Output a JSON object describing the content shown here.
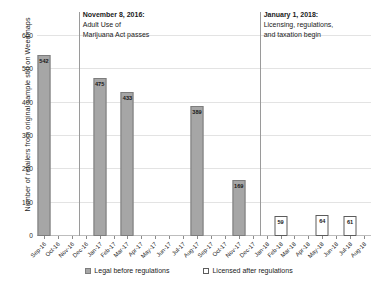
{
  "chart_data": {
    "type": "bar",
    "title": "",
    "xlabel": "",
    "ylabel": "Number of retailers from original sample still on Weedmaps",
    "ylim": [
      0,
      600
    ],
    "y_ticks": [
      0,
      100,
      200,
      300,
      400,
      500,
      600
    ],
    "grid": true,
    "legend_position": "bottom",
    "categories": [
      "Sep-16",
      "Oct-16",
      "Nov-16",
      "Dec-16",
      "Jan-17",
      "Feb-17",
      "Mar-17",
      "Apr-17",
      "May-17",
      "Jun-17",
      "Jul-17",
      "Aug-17",
      "Sep-17",
      "Oct-17",
      "Nov-17",
      "Dec-17",
      "Jan-18",
      "Feb-18",
      "Mar-18",
      "Apr-18",
      "May-18",
      "Jun-18",
      "Jul-18",
      "Aug-18"
    ],
    "series": [
      {
        "name": "Legal before regulations",
        "color": "#a6a6a6",
        "points": [
          {
            "category": "Sep-16",
            "value": 542
          },
          {
            "category": "Jan-17",
            "value": 475
          },
          {
            "category": "Mar-17",
            "value": 433
          },
          {
            "category": "Aug-17",
            "value": 389
          },
          {
            "category": "Nov-17",
            "value": 169
          }
        ]
      },
      {
        "name": "Licensed after regulations",
        "color": "#ffffff",
        "points": [
          {
            "category": "Feb-18",
            "value": 59
          },
          {
            "category": "May-18",
            "value": 64
          },
          {
            "category": "Jul-18",
            "value": 61
          }
        ]
      }
    ],
    "annotations": [
      {
        "id": "amua-passage",
        "at_category": "Dec-16",
        "title": "November 8, 2016:",
        "lines": [
          "Adult Use of",
          "Marijuana Act passes"
        ]
      },
      {
        "id": "licensing-begin",
        "at_category": "Jan-18",
        "title": "January 1, 2018:",
        "lines": [
          "Licensing, regulations,",
          "and taxation begin"
        ]
      }
    ]
  },
  "legend": {
    "items": [
      {
        "label": "Legal before regulations",
        "swatch": "filled-gray-square"
      },
      {
        "label": "Licensed after regulations",
        "swatch": "outlined-white-square"
      }
    ]
  }
}
